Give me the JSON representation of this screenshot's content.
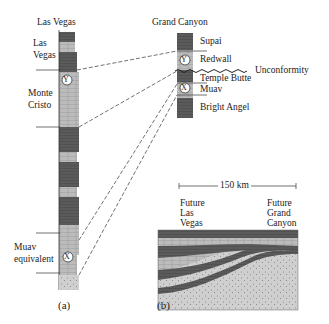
{
  "panel_a": {
    "title": "Las Vegas",
    "units": [
      {
        "label_line1": "Las",
        "label_line2": "Vegas"
      },
      {
        "label_line1": "Monte",
        "label_line2": "Cristo"
      },
      {
        "label_line1": "Muav",
        "label_line2": "equivalent"
      }
    ],
    "markers": {
      "y": "Y",
      "x": "X"
    },
    "caption": "(a)"
  },
  "panel_b": {
    "title": "Grand Canyon",
    "units": [
      "Supai",
      "Redwall",
      "Temple Butte",
      "Muav",
      "Bright Angel"
    ],
    "unconformity_label": "Unconformity",
    "markers": {
      "y": "Y",
      "x": "X"
    },
    "caption": "(b)"
  },
  "cross_section": {
    "scale_label": "150 km",
    "left_label": [
      "Future",
      "Las",
      "Vegas"
    ],
    "right_label": [
      "Future",
      "Grand",
      "Canyon"
    ]
  },
  "colors": {
    "dark": "#555555",
    "mid": "#8a8a8a",
    "light": "#bdbdbd",
    "sand": "#d4d4d4"
  }
}
